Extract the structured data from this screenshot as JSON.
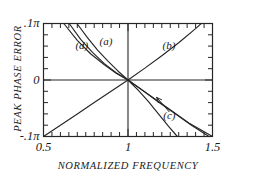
{
  "chart_data": {
    "type": "line",
    "title": "",
    "xlabel": "NORMALIZED FREQUENCY",
    "ylabel": "PEAK PHASE ERROR",
    "xlim": [
      0.5,
      1.5
    ],
    "ylim": [
      -0.1,
      0.1
    ],
    "grid": false,
    "legend_position": "inline-labels",
    "x_ticks_major": [
      {
        "value": 0.5,
        "label": "0.5"
      },
      {
        "value": 1.0,
        "label": "1"
      },
      {
        "value": 1.5,
        "label": "1.5"
      }
    ],
    "x_ticks_minor": [
      0.55,
      0.6,
      0.65,
      0.7,
      0.75,
      0.8,
      0.85,
      0.9,
      0.95,
      1.05,
      1.1,
      1.15,
      1.2,
      1.25,
      1.3,
      1.35,
      1.4,
      1.45
    ],
    "y_ticks_major": [
      {
        "value": 0.1,
        "label": ".1π"
      },
      {
        "value": 0.0,
        "label": "0"
      },
      {
        "value": -0.1,
        "label": "-.1π"
      }
    ],
    "y_ticks_minor": [
      -0.08,
      -0.06,
      -0.04,
      -0.02,
      0.02,
      0.04,
      0.06,
      0.08
    ],
    "axis_lines": {
      "x_at_y": 0.0,
      "y_at_x": 1.0
    },
    "units_note": "Y axis in units of π radians",
    "series": [
      {
        "name": "(a)",
        "label": "(a)",
        "label_x": 0.885,
        "label_y": 0.068,
        "slope_per_unit_x": -0.5,
        "points": [
          {
            "x": 0.698,
            "y": 0.1
          },
          {
            "x": 0.76,
            "y": 0.075
          },
          {
            "x": 0.82,
            "y": 0.053
          },
          {
            "x": 0.88,
            "y": 0.034
          },
          {
            "x": 0.94,
            "y": 0.016
          },
          {
            "x": 1.0,
            "y": 0.0
          },
          {
            "x": 1.06,
            "y": -0.018
          },
          {
            "x": 1.12,
            "y": -0.038
          },
          {
            "x": 1.18,
            "y": -0.06
          },
          {
            "x": 1.24,
            "y": -0.082
          },
          {
            "x": 1.292,
            "y": -0.1
          }
        ]
      },
      {
        "name": "(b)",
        "label": "(b)",
        "label_x": 1.258,
        "label_y": 0.06,
        "slope_per_unit_x": 0.2,
        "points": [
          {
            "x": 0.5,
            "y": -0.1
          },
          {
            "x": 0.6,
            "y": -0.08
          },
          {
            "x": 0.7,
            "y": -0.06
          },
          {
            "x": 0.8,
            "y": -0.04
          },
          {
            "x": 0.9,
            "y": -0.02
          },
          {
            "x": 1.0,
            "y": 0.0
          },
          {
            "x": 1.1,
            "y": 0.021
          },
          {
            "x": 1.2,
            "y": 0.043
          },
          {
            "x": 1.3,
            "y": 0.066
          },
          {
            "x": 1.4,
            "y": 0.091
          },
          {
            "x": 1.452,
            "y": 0.105
          }
        ]
      },
      {
        "name": "(c)",
        "label": "(c)",
        "label_x": 1.262,
        "label_y": -0.064,
        "has_leader_arrow": true,
        "leader_from_x": 1.243,
        "leader_from_y": -0.056,
        "leader_to_x": 1.17,
        "leader_to_y": -0.031,
        "slope_per_unit_x": -0.215,
        "points": [
          {
            "x": 0.62,
            "y": 0.1
          },
          {
            "x": 0.7,
            "y": 0.07
          },
          {
            "x": 0.78,
            "y": 0.046
          },
          {
            "x": 0.86,
            "y": 0.027
          },
          {
            "x": 0.93,
            "y": 0.012
          },
          {
            "x": 1.0,
            "y": 0.0
          },
          {
            "x": 1.09,
            "y": -0.019
          },
          {
            "x": 1.18,
            "y": -0.039
          },
          {
            "x": 1.28,
            "y": -0.06
          },
          {
            "x": 1.38,
            "y": -0.081
          },
          {
            "x": 1.5,
            "y": -0.104
          }
        ]
      },
      {
        "name": "(d)",
        "label": "(d)",
        "label_x": 0.742,
        "label_y": 0.06,
        "slope_per_unit_x": -0.245,
        "points": [
          {
            "x": 0.652,
            "y": 0.1
          },
          {
            "x": 0.72,
            "y": 0.072
          },
          {
            "x": 0.79,
            "y": 0.049
          },
          {
            "x": 0.86,
            "y": 0.029
          },
          {
            "x": 0.93,
            "y": 0.013
          },
          {
            "x": 1.0,
            "y": 0.0
          },
          {
            "x": 1.08,
            "y": -0.017
          },
          {
            "x": 1.17,
            "y": -0.036
          },
          {
            "x": 1.26,
            "y": -0.055
          },
          {
            "x": 1.36,
            "y": -0.076
          },
          {
            "x": 1.5,
            "y": -0.1
          }
        ]
      }
    ],
    "colors": {
      "curve": "#262626",
      "frame": "#262626",
      "text": "#1a1a1a",
      "background": "#ffffff"
    }
  }
}
